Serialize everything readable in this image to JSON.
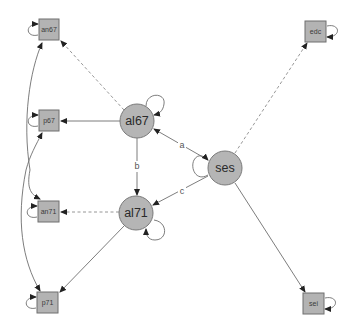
{
  "diagram": {
    "type": "structural-equation-model-path-diagram",
    "colors": {
      "node_fill": "#b5b5b5",
      "node_stroke": "#7a7a7a",
      "edge": "#6e6e6e",
      "background": "#ffffff"
    },
    "latent_nodes": [
      {
        "id": "al67",
        "label": "al67"
      },
      {
        "id": "al71",
        "label": "al71"
      },
      {
        "id": "ses",
        "label": "ses"
      }
    ],
    "manifest_nodes": [
      {
        "id": "an67",
        "label": "an67"
      },
      {
        "id": "p67",
        "label": "p67"
      },
      {
        "id": "an71",
        "label": "an71"
      },
      {
        "id": "p71",
        "label": "p71"
      },
      {
        "id": "edc",
        "label": "edc"
      },
      {
        "id": "sei",
        "label": "sei"
      }
    ],
    "edges": [
      {
        "from": "ses",
        "to": "al67",
        "label": "a",
        "style": "solid"
      },
      {
        "from": "al67",
        "to": "al71",
        "label": "b",
        "style": "solid"
      },
      {
        "from": "ses",
        "to": "al71",
        "label": "c",
        "style": "solid"
      },
      {
        "from": "al67",
        "to": "an67",
        "style": "dashed"
      },
      {
        "from": "al67",
        "to": "p67",
        "style": "solid"
      },
      {
        "from": "al71",
        "to": "an71",
        "style": "dashed"
      },
      {
        "from": "al71",
        "to": "p71",
        "style": "solid"
      },
      {
        "from": "ses",
        "to": "edc",
        "style": "dashed"
      },
      {
        "from": "ses",
        "to": "sei",
        "style": "solid"
      }
    ],
    "covariances": [
      {
        "between": [
          "an67",
          "an71"
        ]
      },
      {
        "between": [
          "p67",
          "p71"
        ]
      }
    ],
    "variances": [
      "al67",
      "al71",
      "ses",
      "an67",
      "p67",
      "an71",
      "p71",
      "edc",
      "sei"
    ]
  }
}
